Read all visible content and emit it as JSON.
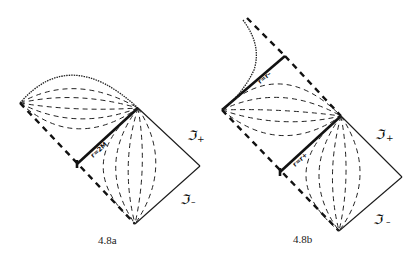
{
  "figures": [
    {
      "id": "4.8a",
      "caption": "4.8a",
      "horizon_label": "r=2M",
      "scri_plus": "ℑ",
      "scri_plus_sub": "+",
      "scri_minus": "ℑ",
      "scri_minus_sub": "–"
    },
    {
      "id": "4.8b",
      "caption": "4.8b",
      "outer_horizon_label": "r=r+",
      "inner_horizon_label": "r=r–",
      "scri_plus": "ℑ",
      "scri_plus_sub": "+",
      "scri_minus": "ℑ",
      "scri_minus_sub": "–"
    }
  ]
}
